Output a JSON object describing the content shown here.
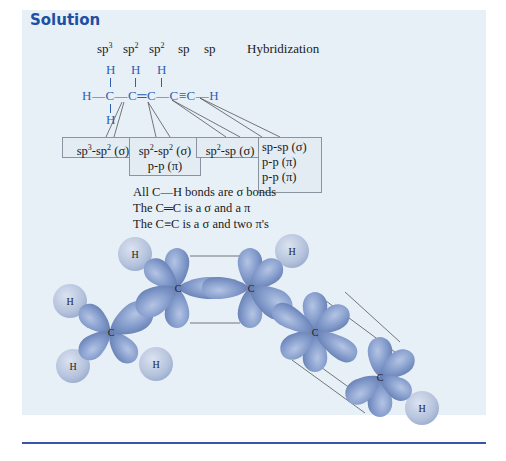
{
  "header": {
    "title": "Solution"
  },
  "hybridization_row": {
    "labels": [
      {
        "base": "sp",
        "sup": "3"
      },
      {
        "base": "sp",
        "sup": "2"
      },
      {
        "base": "sp",
        "sup": "2"
      },
      {
        "base": "sp",
        "sup": ""
      },
      {
        "base": "sp",
        "sup": ""
      }
    ],
    "caption": "Hybridization"
  },
  "structure": {
    "main_chain": "H—C—C═C—C≡C—H",
    "atoms": {
      "h_top_1": "H",
      "h_top_2": "H",
      "h_top_3": "H",
      "h_bottom": "H",
      "h_left": "H",
      "c1": "C",
      "c2": "C",
      "c3": "C",
      "c4": "C",
      "c5": "C",
      "h_right": "H"
    }
  },
  "bond_boxes": [
    {
      "lines": [
        "sp3-sp2 (σ)"
      ],
      "line1_parts": {
        "a": "sp",
        "a_sup": "3",
        "b": "-sp",
        "b_sup": "2",
        "rest": " (σ)"
      }
    },
    {
      "lines": [
        "sp2-sp2 (σ)",
        "p-p (π)"
      ],
      "line1_parts": {
        "a": "sp",
        "a_sup": "2",
        "b": "-sp",
        "b_sup": "2",
        "rest": " (σ)"
      },
      "line2": "p-p (π)"
    },
    {
      "lines": [
        "sp2-sp (σ)"
      ],
      "line1_parts": {
        "a": "sp",
        "a_sup": "2",
        "b": "-sp (σ)"
      }
    },
    {
      "lines": [
        "sp-sp (σ)",
        "p-p (π)",
        "p-p (π)"
      ],
      "line1": "sp-sp (σ)",
      "line2": "p-p (π)",
      "line3": "p-p (π)"
    }
  ],
  "notes": [
    "All C—H bonds are σ bonds",
    "The C═C is a σ and a π",
    "The C≡C is a σ and two π's"
  ],
  "orbital_diagram": {
    "carbon_label": "C",
    "hydrogen_label": "H",
    "colors": {
      "lobe": "#7f98c9",
      "lobe_dark": "#5f78ad",
      "hydrogen": "#b9c6de",
      "panel_bg": "#e8f0f7",
      "title": "#1d4fa3",
      "structure_text": "#2f5fb3",
      "rule": "#3a55a5"
    }
  }
}
